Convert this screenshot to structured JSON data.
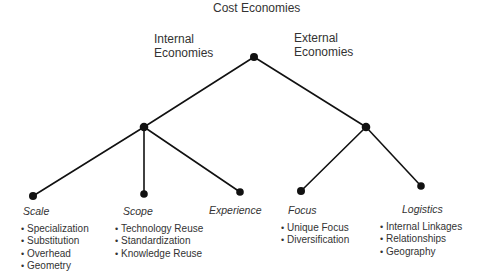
{
  "title": "Cost Economies",
  "branches": {
    "internal": {
      "line1": "Internal",
      "line2": "Economies"
    },
    "external": {
      "line1": "External",
      "line2": "Economies"
    }
  },
  "leaves": [
    {
      "label": "Scale",
      "items": [
        "Specialization",
        "Substitution",
        "Overhead",
        "Geometry"
      ]
    },
    {
      "label": "Scope",
      "items": [
        "Technology Reuse",
        "Standardization",
        "Knowledge Reuse"
      ]
    },
    {
      "label": "Experience",
      "items": []
    },
    {
      "label": "Focus",
      "items": [
        "Unique Focus",
        "Diversification"
      ]
    },
    {
      "label": "Logistics",
      "items": [
        "Internal Linkages",
        "Relationships",
        "Geography"
      ]
    }
  ],
  "colors": {
    "line": "#111111",
    "node": "#111111",
    "text": "#333333"
  }
}
